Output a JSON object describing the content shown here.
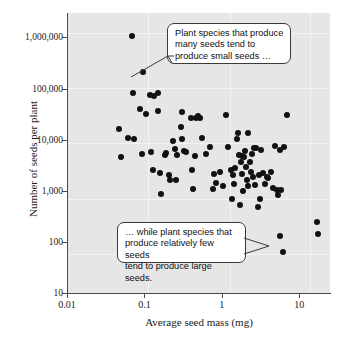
{
  "figure": {
    "background_color": "#ffffff",
    "plot_background_color": "#e6e6e6",
    "point_color": "#111111",
    "axis_color": "#4a4a4a",
    "gridline_color": "#f4f4f4"
  },
  "chart_data": {
    "type": "scatter",
    "title": "",
    "xlabel": "Average seed mass (mg)",
    "ylabel": "Number of seeds per plant",
    "xscale": "log",
    "yscale": "log",
    "xlim": [
      0.01,
      25
    ],
    "ylim": [
      10,
      3000000
    ],
    "xticks": [
      0.01,
      0.1,
      1,
      10
    ],
    "xticklabels": [
      "0.01",
      "0.1",
      "1",
      "10"
    ],
    "yticks": [
      10,
      100,
      1000,
      10000,
      100000,
      1000000
    ],
    "yticklabels": [
      "10",
      "100",
      "1,000",
      "10,000",
      "100,000",
      "1,000,000"
    ],
    "grid": true,
    "legend": null,
    "n_points": 95,
    "points": [
      [
        0.047,
        16000
      ],
      [
        0.05,
        4500
      ],
      [
        0.062,
        11000
      ],
      [
        0.07,
        1050000
      ],
      [
        0.072,
        80000
      ],
      [
        0.073,
        10500
      ],
      [
        0.088,
        39000
      ],
      [
        0.092,
        5300
      ],
      [
        0.097,
        210000
      ],
      [
        0.105,
        32000
      ],
      [
        0.118,
        74000
      ],
      [
        0.122,
        5800
      ],
      [
        0.128,
        2600
      ],
      [
        0.15,
        83000
      ],
      [
        0.152,
        37000
      ],
      [
        0.16,
        2200
      ],
      [
        0.165,
        880
      ],
      [
        0.185,
        5000
      ],
      [
        0.192,
        5400
      ],
      [
        0.205,
        2050
      ],
      [
        0.215,
        1600
      ],
      [
        0.235,
        9200
      ],
      [
        0.245,
        6700
      ],
      [
        0.262,
        4900
      ],
      [
        0.3,
        17500
      ],
      [
        0.305,
        35000
      ],
      [
        0.31,
        10500
      ],
      [
        0.325,
        6100
      ],
      [
        0.345,
        5800
      ],
      [
        0.4,
        26000
      ],
      [
        0.415,
        2500
      ],
      [
        0.43,
        1080
      ],
      [
        0.445,
        4800
      ],
      [
        0.47,
        26000
      ],
      [
        0.49,
        28500
      ],
      [
        0.52,
        27000
      ],
      [
        0.56,
        10800
      ],
      [
        0.62,
        5300
      ],
      [
        0.7,
        7200
      ],
      [
        0.76,
        1100
      ],
      [
        0.8,
        2150
      ],
      [
        0.84,
        1450
      ],
      [
        0.95,
        2350
      ],
      [
        1.05,
        1250
      ],
      [
        1.15,
        30000
      ],
      [
        1.2,
        7200
      ],
      [
        1.3,
        2600
      ],
      [
        1.35,
        680
      ],
      [
        1.45,
        1350
      ],
      [
        1.5,
        2800
      ],
      [
        1.55,
        10500
      ],
      [
        1.6,
        13500
      ],
      [
        1.65,
        5000
      ],
      [
        1.7,
        520
      ],
      [
        1.75,
        3700
      ],
      [
        1.8,
        4700
      ],
      [
        1.85,
        2100
      ],
      [
        1.9,
        1000
      ],
      [
        1.95,
        4500
      ],
      [
        2.0,
        6000
      ],
      [
        2.05,
        2900
      ],
      [
        2.1,
        1600
      ],
      [
        2.15,
        13200
      ],
      [
        2.2,
        1250
      ],
      [
        2.3,
        3600
      ],
      [
        2.4,
        2300
      ],
      [
        2.5,
        1900
      ],
      [
        2.6,
        6900
      ],
      [
        2.7,
        1300
      ],
      [
        2.8,
        7000
      ],
      [
        2.9,
        480
      ],
      [
        3.0,
        2000
      ],
      [
        3.1,
        690
      ],
      [
        3.2,
        6200
      ],
      [
        3.4,
        2250
      ],
      [
        3.6,
        1350
      ],
      [
        3.8,
        1900
      ],
      [
        4.0,
        1800
      ],
      [
        4.3,
        2300
      ],
      [
        4.6,
        1150
      ],
      [
        4.9,
        7500
      ],
      [
        5.1,
        1050
      ],
      [
        5.4,
        830
      ],
      [
        5.6,
        6200
      ],
      [
        5.7,
        128
      ],
      [
        5.9,
        1050
      ],
      [
        6.1,
        63
      ],
      [
        6.4,
        7200
      ],
      [
        7.0,
        31000
      ],
      [
        17.0,
        240
      ],
      [
        17.5,
        140
      ],
      [
        0.135,
        72000
      ],
      [
        0.255,
        1620
      ],
      [
        1.4,
        2000
      ],
      [
        2.45,
        5200
      ]
    ],
    "annotations": [
      {
        "id": "callout-top",
        "text": "Plant species that produce\nmany seeds tend to\nproduce small seeds …",
        "points_to": "upper-left cluster of high-seed, small-mass species"
      },
      {
        "id": "callout-bottom",
        "text": "… while plant species that\nproduce relatively few seeds\ntend to produce large seeds.",
        "points_to": "lower-right cluster of low-seed, large-mass species"
      }
    ]
  }
}
